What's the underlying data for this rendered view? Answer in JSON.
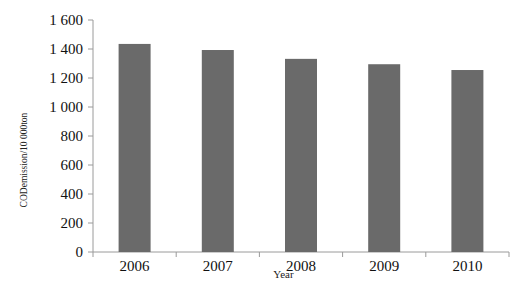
{
  "chart_data": {
    "type": "bar",
    "title": "",
    "xlabel": "Year",
    "ylabel": "CODemission/10 000ton",
    "categories": [
      "2006",
      "2007",
      "2008",
      "2009",
      "2010"
    ],
    "values": [
      1435,
      1393,
      1332,
      1295,
      1255
    ],
    "ylim": [
      0,
      1600
    ],
    "yticks": [
      0,
      200,
      400,
      600,
      800,
      1000,
      1200,
      1400,
      1600
    ],
    "ytick_labels": [
      "0",
      "200",
      "400",
      "600",
      "800",
      "1 000",
      "1 200",
      "1 400",
      "1 600"
    ],
    "grid": false,
    "legend": null,
    "bar_color": "#6a6a6a",
    "axis_color": "#9a9a9a"
  }
}
